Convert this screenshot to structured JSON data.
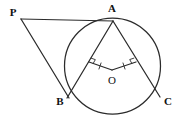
{
  "figure": {
    "width": 178,
    "height": 123,
    "background_color": "#ffffff",
    "stroke_color": "#2b2b2b",
    "label_color": "#111111"
  },
  "circle": {
    "center_x": 112.5,
    "center_y": 66,
    "radius": 48
  },
  "points": {
    "P": {
      "label": "P",
      "x": 21,
      "y": 19,
      "label_x": 13,
      "label_y": 12
    },
    "A": {
      "label": "A",
      "x": 113,
      "y": 20,
      "label_x": 112,
      "label_y": 8
    },
    "B": {
      "label": "B",
      "x": 68,
      "y": 96,
      "label_x": 60,
      "label_y": 101
    },
    "C": {
      "label": "C",
      "x": 159,
      "y": 95,
      "label_x": 168,
      "label_y": 101
    },
    "O": {
      "label": "O",
      "x": 112,
      "y": 70,
      "label_x": 112,
      "label_y": 80
    }
  },
  "segments": [
    {
      "name": "segment-PA",
      "from": "P",
      "to": "A",
      "x1": 21,
      "y1": 19,
      "x2": 113,
      "y2": 21
    },
    {
      "name": "segment-PB",
      "from": "P",
      "to": "B",
      "x1": 21,
      "y1": 19,
      "x2": 69,
      "y2": 98
    },
    {
      "name": "segment-AB",
      "from": "A",
      "to": "B",
      "x1": 113,
      "y1": 21,
      "x2": 67,
      "y2": 98
    },
    {
      "name": "segment-AC",
      "from": "A",
      "to": "C",
      "x1": 113,
      "y1": 21,
      "x2": 160,
      "y2": 97
    },
    {
      "name": "segment-OM",
      "from": "O",
      "to": "midpoint-AB",
      "x1": 112,
      "y1": 70,
      "x2": 89,
      "y2": 62
    },
    {
      "name": "segment-ON",
      "from": "O",
      "to": "midpoint-AC",
      "x1": 112,
      "y1": 70,
      "x2": 136,
      "y2": 62
    }
  ],
  "marks": {
    "right_angle_left": {
      "name": "right-angle-mark-AB",
      "description": "right angle square where O-segment meets chord AB",
      "x": 89,
      "y": 62
    },
    "right_angle_right": {
      "name": "right-angle-mark-AC",
      "description": "right angle square where O-segment meets chord AC",
      "x": 136,
      "y": 62
    },
    "tick_left": {
      "name": "equal-length-tick-left",
      "description": "single tick on segment from O to chord AB",
      "x": 100,
      "y": 66
    },
    "tick_right": {
      "name": "equal-length-tick-right",
      "description": "single tick on segment from O to chord AC",
      "x": 124,
      "y": 66
    }
  }
}
